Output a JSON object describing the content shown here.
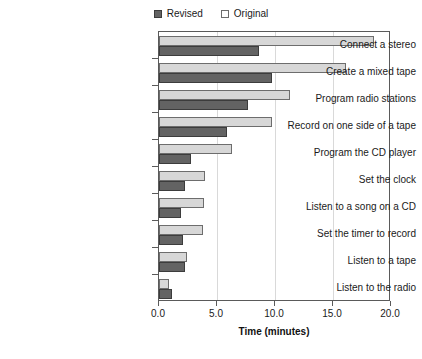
{
  "chart_data": {
    "type": "bar",
    "orientation": "horizontal",
    "title": "",
    "xlabel": "Time (minutes)",
    "ylabel": "",
    "xlim": [
      0.0,
      20.0
    ],
    "xticks": [
      "0.0",
      "5.0",
      "10.0",
      "15.0",
      "20.0"
    ],
    "xtick_values": [
      0,
      5,
      10,
      15,
      20
    ],
    "grid": "vertical",
    "legend_position": "top-center",
    "categories": [
      "Connect a stereo",
      "Create a mixed tape",
      "Program radio stations",
      "Record on one side of a tape",
      "Program the CD player",
      "Set the clock",
      "Listen to a song on a CD",
      "Set the timer to record",
      "Listen to a tape",
      "Listen to the radio"
    ],
    "series": [
      {
        "name": "Revised",
        "color": "#636363",
        "values": [
          8.6,
          9.7,
          7.7,
          5.9,
          2.8,
          2.2,
          1.9,
          2.1,
          2.2,
          1.1
        ]
      },
      {
        "name": "Original",
        "color": "#d7d7d7",
        "values": [
          18.5,
          16.1,
          11.3,
          9.7,
          6.3,
          4.0,
          3.9,
          3.8,
          2.4,
          0.9
        ]
      }
    ]
  },
  "legend": {
    "entries": [
      {
        "label": "Revised",
        "swatch": "dark-swatch-icon"
      },
      {
        "label": "Original",
        "swatch": "light-swatch-icon"
      }
    ]
  },
  "axis": {
    "x_title": "Time (minutes)"
  }
}
